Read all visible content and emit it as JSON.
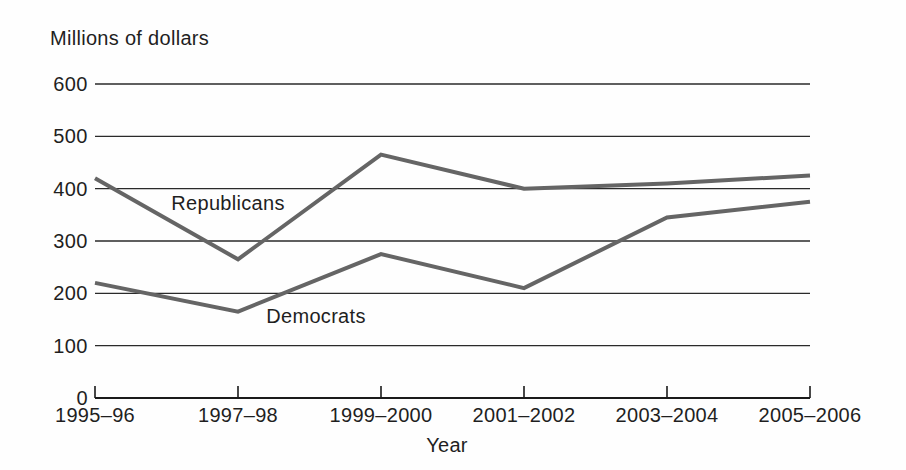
{
  "chart_data": {
    "type": "line",
    "title": "Millions of dollars",
    "xlabel": "Year",
    "ylabel": "Millions of dollars",
    "categories": [
      "1995–96",
      "1997–98",
      "1999–2000",
      "2001–2002",
      "2003–2004",
      "2005–2006"
    ],
    "series": [
      {
        "name": "Republicans",
        "values": [
          420,
          265,
          465,
          400,
          410,
          425
        ]
      },
      {
        "name": "Democrats",
        "values": [
          220,
          165,
          275,
          210,
          345,
          375
        ]
      }
    ],
    "ylim": [
      0,
      600
    ],
    "yticks": [
      0,
      100,
      200,
      300,
      400,
      500,
      600
    ],
    "grid": true,
    "legend": "inline-annotations",
    "colors": {
      "line": "#656565",
      "gridline": "#2a2a2a",
      "axis": "#1a1a1a",
      "text": "#1f1f1f"
    }
  }
}
